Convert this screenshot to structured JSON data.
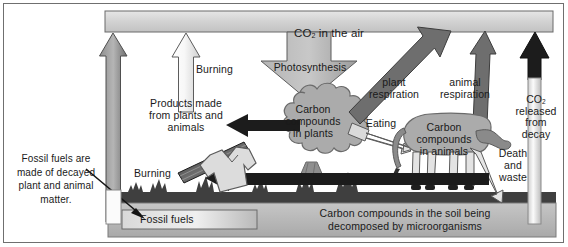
{
  "diagram": {
    "type": "carbon-cycle-diagram",
    "palette": {
      "air_box_fill": "#d6d6d6",
      "air_box_stroke": "#7a7a7a",
      "plant_fill": "#a8a8a8",
      "animal_fill": "#a8a8a8",
      "soil_fill": "#b9b9b9",
      "ground_dark": "#4a4a4a",
      "arrow_black": "#1c1c1c",
      "arrow_light": "#f2f2f2",
      "arrow_mid": "#9d9d9d",
      "text": "#1a1a1a",
      "frame_stroke": "#6f6f6f"
    },
    "labels": {
      "co2_air": "CO",
      "co2_air_sub": "2",
      "co2_air_rest": " in the air",
      "photosynthesis": "Photosynthesis",
      "carbon_in_plants": "Carbon\ncompounds\nin plants",
      "carbon_in_animals": "Carbon\ncompounds\nin animals",
      "plant_respiration": "plant\nrespiration",
      "animal_respiration": "animal\nrespiration",
      "co2_decay": "CO",
      "co2_decay_sub": "2",
      "co2_decay_rest": "\nreleased\nfrom\ndecay",
      "eating": "Eating",
      "death_and_waste": "Death\nand\nwaste",
      "products": "Products made\nfrom plants and\nanimals",
      "burning_top": "Burning",
      "burning_bottom": "Burning",
      "fossil_fuels_box": "Fossil fuels",
      "fossil_fuels_note": "Fossil fuels are\nmade of decayed\nplant and animal\nmatter.",
      "soil_text": "Carbon compounds in the soil being\ndecomposed by microorganisms"
    },
    "icons": {
      "plank": "wooden-plank-icon",
      "shirt": "clothing-shirt-icon",
      "cow": "cow-silhouette-icon",
      "tree": "tree-silhouette-icon",
      "grass": "grass-icon"
    }
  }
}
